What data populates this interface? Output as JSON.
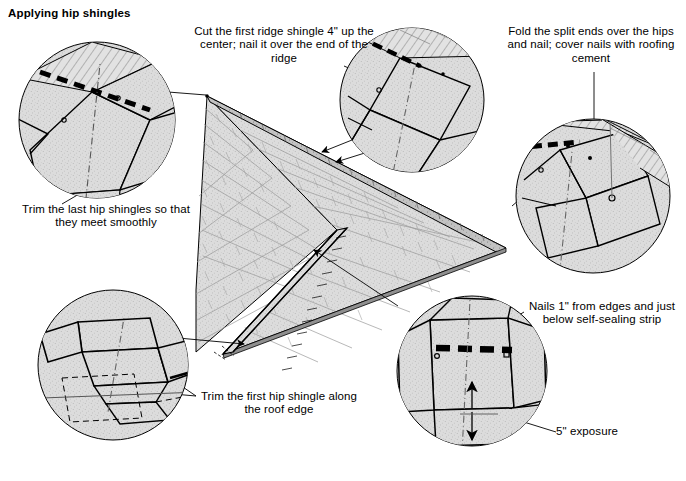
{
  "figure": {
    "title": "Applying hip shingles",
    "type": "technical-illustration",
    "background_color": "#ffffff",
    "line_color": "#000000",
    "shingle_fill": "#d9d9d9",
    "shingle_fill_dark": "#b8b8b8"
  },
  "callouts": [
    {
      "id": "ridge-shingle",
      "text": "Cut the first ridge shingle 4\" up the center; nail it over the end of the ridge",
      "position": "top-center",
      "detail_circle": "top-center-inset"
    },
    {
      "id": "fold-split-ends",
      "text": "Fold the split ends over the hips and nail; cover nails with roofing cement",
      "position": "top-right",
      "detail_circle": "right-inset"
    },
    {
      "id": "trim-last-hip",
      "text": "Trim the last hip shingles so that they meet smoothly",
      "position": "left",
      "detail_circle": "top-left-inset"
    },
    {
      "id": "trim-first-hip",
      "text": "Trim the first hip shingle along the roof edge",
      "position": "bottom-center",
      "detail_circle": "bottom-left-inset"
    },
    {
      "id": "nail-placement",
      "text": "Nails 1\" from edges and just below self-sealing strip",
      "position": "right",
      "detail_circle": "bottom-right-inset"
    },
    {
      "id": "exposure",
      "text": "5\" exposure",
      "position": "bottom-right",
      "detail_circle": "bottom-right-inset"
    }
  ],
  "measurements": [
    {
      "label": "4\"",
      "meaning": "cut up the center of first ridge shingle"
    },
    {
      "label": "1\"",
      "meaning": "nail distance from shingle edges"
    },
    {
      "label": "5\"",
      "meaning": "shingle exposure"
    }
  ],
  "detail_circles": [
    {
      "id": "top-left-inset",
      "cx": 97,
      "cy": 120,
      "r": 78
    },
    {
      "id": "top-center-inset",
      "cx": 412,
      "cy": 100,
      "r": 72
    },
    {
      "id": "right-inset",
      "cx": 593,
      "cy": 196,
      "r": 77
    },
    {
      "id": "bottom-left-inset",
      "cx": 113,
      "cy": 365,
      "r": 75
    },
    {
      "id": "bottom-right-inset",
      "cx": 472,
      "cy": 371,
      "r": 75
    }
  ]
}
